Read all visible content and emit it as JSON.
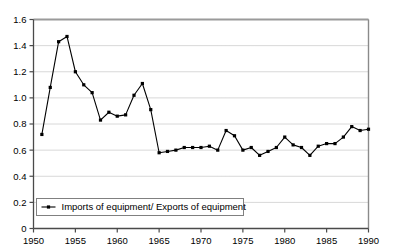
{
  "chart_data": {
    "type": "line",
    "title": "",
    "subtitle": "",
    "xlabel": "",
    "ylabel": "",
    "xlim": [
      1950,
      1990
    ],
    "ylim": [
      0,
      1.6
    ],
    "grid": true,
    "grid_axis": "y",
    "legend_position": "bottom-left",
    "marker": "square",
    "line_color": "#000000",
    "x_tick_labels": [
      "1950",
      "1955",
      "1960",
      "1965",
      "1970",
      "1975",
      "1980",
      "1985",
      "1990"
    ],
    "x_ticks": [
      1950,
      1955,
      1960,
      1965,
      1970,
      1975,
      1980,
      1985,
      1990
    ],
    "y_tick_labels": [
      "0",
      "0.2",
      "0.4",
      "0.6",
      "0.8",
      "1.0",
      "1.2",
      "1.4",
      "1.6"
    ],
    "y_ticks": [
      0,
      0.2,
      0.4,
      0.6,
      0.8,
      1.0,
      1.2,
      1.4,
      1.6
    ],
    "series": [
      {
        "name": "Imports of equipment/ Exports of equipment",
        "x": [
          1951,
          1952,
          1953,
          1954,
          1955,
          1956,
          1957,
          1958,
          1959,
          1960,
          1961,
          1962,
          1963,
          1964,
          1965,
          1966,
          1967,
          1968,
          1969,
          1970,
          1971,
          1972,
          1973,
          1974,
          1975,
          1976,
          1977,
          1978,
          1979,
          1980,
          1981,
          1982,
          1983,
          1984,
          1985,
          1986,
          1987,
          1988,
          1989,
          1990
        ],
        "values": [
          0.72,
          1.08,
          1.43,
          1.47,
          1.2,
          1.1,
          1.04,
          0.83,
          0.89,
          0.86,
          0.87,
          1.02,
          1.11,
          0.91,
          0.58,
          0.59,
          0.6,
          0.62,
          0.62,
          0.62,
          0.63,
          0.6,
          0.75,
          0.71,
          0.6,
          0.62,
          0.56,
          0.59,
          0.62,
          0.7,
          0.64,
          0.62,
          0.56,
          0.63,
          0.65,
          0.65,
          0.7,
          0.78,
          0.75,
          0.76
        ]
      }
    ]
  },
  "legend": {
    "entries": [
      {
        "label": "Imports of equipment/ Exports of equipment",
        "marker": "line-square-marker"
      }
    ]
  }
}
